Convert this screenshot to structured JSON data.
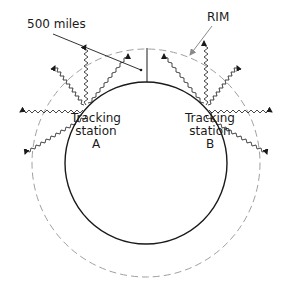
{
  "diagram": {
    "labels": {
      "distance": "500 miles",
      "rim": "RIM"
    },
    "stations": [
      {
        "line1": "Tracking",
        "line2": "station",
        "id": "A"
      },
      {
        "line1": "Tracking",
        "line2": "station",
        "id": "B"
      }
    ],
    "earth_circle": {
      "cx": 146,
      "cy": 163,
      "r": 81,
      "stroke": "#1a1a1a"
    },
    "rim_circle": {
      "cx": 146,
      "cy": 163,
      "r": 114,
      "stroke": "#9a9a9a",
      "dashed": true
    },
    "colors": {
      "line": "#1a1a1a",
      "rim": "#9a9a9a",
      "background": "#ffffff"
    }
  }
}
